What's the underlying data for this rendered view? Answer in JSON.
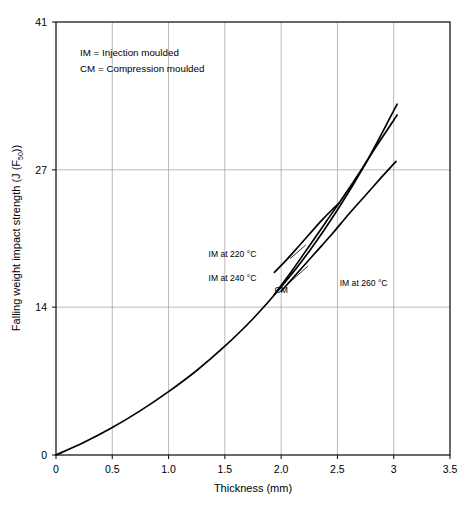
{
  "chart_data": {
    "type": "line",
    "title": "",
    "xlabel": "Thickness (mm)",
    "ylabel": "Falling weight impact strength (J (F",
    "ylabel_sub": "50",
    "ylabel_tail": "))",
    "xlim": [
      0,
      3.5
    ],
    "ylim": [
      0,
      41
    ],
    "grid": true,
    "legend_position": "inside-top-left-as-note",
    "xticks": [
      "0",
      "0.5",
      "1.0",
      "1.5",
      "2.0",
      "2.5",
      "3",
      "3.5"
    ],
    "xtick_values": [
      0,
      0.5,
      1.0,
      1.5,
      2.0,
      2.5,
      3.0,
      3.5
    ],
    "yticks": [
      "0",
      "14",
      "27",
      "41"
    ],
    "ytick_values": [
      0,
      14,
      27,
      41
    ],
    "notes": [
      "IM = Injection moulded",
      "CM = Compression moulded"
    ],
    "series": [
      {
        "name": "CM",
        "label": "CM",
        "label_x": 2.0,
        "label_y": 15.6,
        "x": [
          0.0,
          0.25,
          0.5,
          0.75,
          1.0,
          1.25,
          1.5,
          1.75,
          2.0,
          2.25,
          2.5,
          2.75,
          3.0,
          3.03
        ],
        "y": [
          0.0,
          1.2,
          2.6,
          4.2,
          6.0,
          8.0,
          10.3,
          12.9,
          15.9,
          19.3,
          23.2,
          27.6,
          32.6,
          33.2
        ]
      },
      {
        "name": "IM at 220 °C",
        "label": "IM at 220 °C",
        "label_x": 1.78,
        "label_y": 19.0,
        "leader": [
          [
            2.08,
            18.6
          ],
          [
            2.22,
            19.9
          ]
        ],
        "x": [
          1.94,
          2.05,
          2.15,
          2.25,
          2.35,
          2.45,
          2.52
        ],
        "y": [
          17.3,
          18.5,
          19.7,
          20.9,
          22.1,
          23.2,
          23.9
        ]
      },
      {
        "name": "IM at 240 °C",
        "label": "IM at 240 °C",
        "label_x": 1.78,
        "label_y": 16.8,
        "leader": [
          [
            2.08,
            16.4
          ],
          [
            2.24,
            17.9
          ]
        ],
        "x": [
          2.0,
          2.15,
          2.3,
          2.45,
          2.6,
          2.75,
          2.9,
          3.02
        ],
        "y": [
          15.5,
          17.3,
          19.1,
          20.9,
          22.8,
          24.6,
          26.4,
          27.8
        ]
      },
      {
        "name": "IM at 260 °C",
        "label": "IM at 260 °C",
        "label_x": 2.52,
        "label_y": 16.3,
        "x": [
          1.94,
          2.1,
          2.25,
          2.4,
          2.55,
          2.7,
          2.85,
          3.0,
          3.03
        ],
        "y": [
          15.2,
          17.5,
          19.8,
          22.1,
          24.4,
          26.8,
          29.3,
          31.7,
          32.2
        ]
      }
    ]
  }
}
